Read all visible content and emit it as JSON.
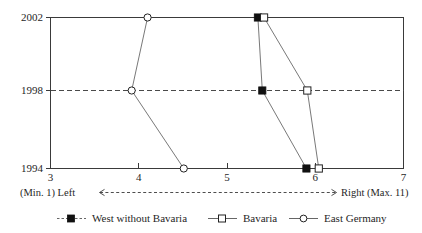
{
  "chart_data": {
    "type": "line",
    "orientation": "horizontal",
    "title": "",
    "subtitle": "",
    "xlabel": "(Min. 1) Left <-------> Right (Max. 11)",
    "ylabel": "",
    "xlim": [
      3,
      7
    ],
    "ylim_categories": [
      "1994",
      "1998",
      "2002"
    ],
    "x_ticks": [
      "3",
      "4",
      "5",
      "6",
      "7"
    ],
    "x_tick_values": [
      3,
      4,
      5,
      6,
      7
    ],
    "y_ticks": [
      "2002",
      "1998",
      "1994"
    ],
    "y_tick_values": [
      2002,
      1998,
      1994
    ],
    "grid": "dashed horizontal line at 1998 only",
    "legend_position": "bottom-center",
    "categories": [
      1994,
      1998,
      2002
    ],
    "series": [
      {
        "name": "West without Bavaria",
        "marker": "filled-square",
        "line_style": "solid",
        "values": [
          5.9,
          5.4,
          5.35
        ]
      },
      {
        "name": "Bavaria",
        "marker": "open-square",
        "line_style": "solid",
        "values": [
          6.04,
          5.91,
          5.42
        ]
      },
      {
        "name": "East Germany",
        "marker": "open-circle",
        "line_style": "solid",
        "values": [
          4.51,
          3.92,
          4.1
        ]
      }
    ]
  },
  "axis_caption": {
    "left_text": "(Min. 1) Left",
    "right_text": "Right (Max. 11)"
  },
  "legend": {
    "items": [
      {
        "label": "West without Bavaria",
        "marker": "filled-square",
        "line": "dashed"
      },
      {
        "label": "Bavaria",
        "marker": "open-square",
        "line": "solid"
      },
      {
        "label": "East Germany",
        "marker": "open-circle",
        "line": "solid"
      }
    ]
  },
  "ticks": {
    "x": [
      {
        "label": "3"
      },
      {
        "label": "4"
      },
      {
        "label": "5"
      },
      {
        "label": "6"
      },
      {
        "label": "7"
      }
    ],
    "y": [
      {
        "label": "2002"
      },
      {
        "label": "1998"
      },
      {
        "label": "1994"
      }
    ]
  }
}
